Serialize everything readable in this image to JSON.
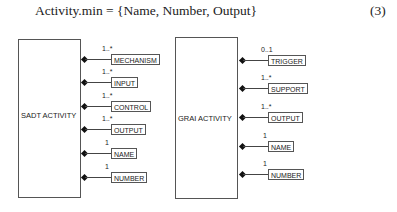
{
  "equation": {
    "text": "Activity.min = {Name, Number, Output}",
    "number": "(3)"
  },
  "diagrams": [
    {
      "name": "SADT ACTIVITY",
      "attributes": [
        {
          "label": "MECHANISM",
          "multiplicity": "1..*"
        },
        {
          "label": "INPUT",
          "multiplicity": "1..*"
        },
        {
          "label": "CONTROL",
          "multiplicity": "1..*"
        },
        {
          "label": "OUTPUT",
          "multiplicity": "1..*"
        },
        {
          "label": "NAME",
          "multiplicity": "1"
        },
        {
          "label": "NUMBER",
          "multiplicity": "1"
        }
      ]
    },
    {
      "name": "GRAI ACTIVITY",
      "attributes": [
        {
          "label": "TRIGGER",
          "multiplicity": "0..1"
        },
        {
          "label": "SUPPORT",
          "multiplicity": "1..*"
        },
        {
          "label": "OUTPUT",
          "multiplicity": "1..*"
        },
        {
          "label": "NAME",
          "multiplicity": "1"
        },
        {
          "label": "NUMBER",
          "multiplicity": "1"
        }
      ]
    }
  ]
}
